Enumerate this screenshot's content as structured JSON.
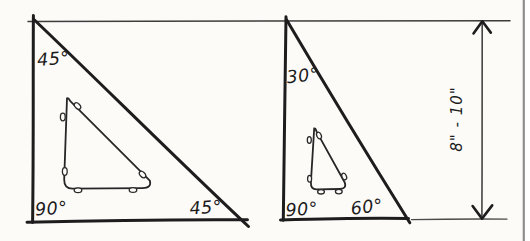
{
  "figure": {
    "kind": "hand-drawn sketch",
    "left_triangle": {
      "description": "45-degree drafting triangle with cutout",
      "angles": {
        "top": "45°",
        "bottom_left": "90°",
        "bottom_right": "45°"
      }
    },
    "right_triangle": {
      "description": "30/60-degree drafting triangle with cutout",
      "angles": {
        "top": "30°",
        "bottom_left": "90°",
        "bottom_right": "60°"
      }
    },
    "dimension": {
      "label": "8\" - 10\""
    },
    "colors": {
      "ink": "#1d1d1d",
      "paper": "#fcfbf8",
      "page_border": "#8e8e8e"
    }
  }
}
